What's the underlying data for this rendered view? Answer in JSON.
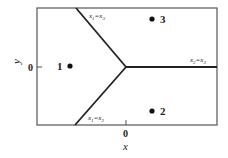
{
  "diagram": {
    "axes": {
      "x_label": "x",
      "y_label": "y",
      "x_tick": "0",
      "y_tick": "0"
    },
    "points": [
      {
        "id": "1",
        "label": "1"
      },
      {
        "id": "2",
        "label": "2"
      },
      {
        "id": "3",
        "label": "3"
      }
    ],
    "boundaries": [
      {
        "id": "upper",
        "label": "x1=x3",
        "sub_a": "1",
        "sub_b": "3"
      },
      {
        "id": "lower",
        "label": "x1=x2",
        "sub_a": "1",
        "sub_b": "2"
      },
      {
        "id": "right",
        "label": "x2=x3",
        "sub_a": "2",
        "sub_b": "3"
      }
    ],
    "colors": {
      "frame": "#555555",
      "boundary": "#222222",
      "point": "#111111",
      "background": "#ffffff"
    }
  }
}
